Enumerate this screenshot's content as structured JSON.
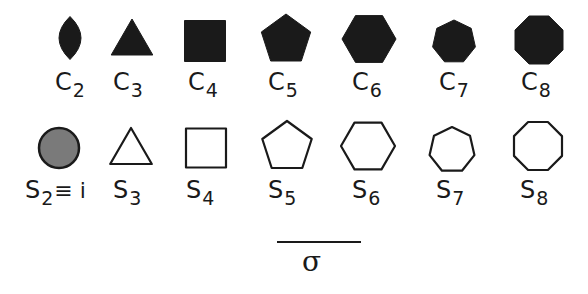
{
  "colors": {
    "ink": "#1a1a1a",
    "s2_fill": "#7a7a7a",
    "background": "#ffffff"
  },
  "rows": {
    "cyclic": {
      "style": "filled",
      "items": [
        {
          "symbol": "C",
          "order": "2",
          "shape": "lens-icon",
          "cx": 70,
          "cy": 38,
          "w": 22,
          "h": 43,
          "label_x": 55,
          "label_y": 70
        },
        {
          "symbol": "C",
          "order": "3",
          "shape": "triangle-icon",
          "cx": 132,
          "cy": 43,
          "sides": 3,
          "r": 24,
          "label_x": 113,
          "label_y": 70
        },
        {
          "symbol": "C",
          "order": "4",
          "shape": "square-icon",
          "cx": 205,
          "cy": 41,
          "w": 41,
          "h": 41,
          "label_x": 188,
          "label_y": 70
        },
        {
          "symbol": "C",
          "order": "5",
          "shape": "pentagon-icon",
          "cx": 286,
          "cy": 40,
          "sides": 5,
          "r": 26,
          "label_x": 268,
          "label_y": 70
        },
        {
          "symbol": "C",
          "order": "6",
          "shape": "hexagon-icon",
          "cx": 369,
          "cy": 39,
          "sides": 6,
          "r": 27,
          "label_x": 352,
          "label_y": 70
        },
        {
          "symbol": "C",
          "order": "7",
          "shape": "heptagon-icon",
          "cx": 454,
          "cy": 42,
          "sides": 7,
          "r": 22,
          "label_x": 439,
          "label_y": 70
        },
        {
          "symbol": "C",
          "order": "8",
          "shape": "octagon-icon",
          "cx": 539,
          "cy": 40,
          "sides": 8,
          "r": 26,
          "label_x": 521,
          "label_y": 70
        }
      ]
    },
    "improper": {
      "style": "outline",
      "items": [
        {
          "symbol": "S",
          "order": "2",
          "extra": "≡ i",
          "shape": "circle-icon",
          "cx": 59,
          "cy": 148,
          "r": 20,
          "label_x": 25,
          "label_y": 178
        },
        {
          "symbol": "S",
          "order": "3",
          "shape": "triangle-icon",
          "cx": 131,
          "cy": 152,
          "sides": 3,
          "r": 24,
          "label_x": 113,
          "label_y": 178
        },
        {
          "symbol": "S",
          "order": "4",
          "shape": "square-icon",
          "cx": 206,
          "cy": 148,
          "w": 40,
          "h": 39,
          "label_x": 186,
          "label_y": 178
        },
        {
          "symbol": "S",
          "order": "5",
          "shape": "pentagon-icon",
          "cx": 287,
          "cy": 147,
          "sides": 5,
          "r": 26,
          "label_x": 268,
          "label_y": 178
        },
        {
          "symbol": "S",
          "order": "6",
          "shape": "hexagon-icon",
          "cx": 368,
          "cy": 146,
          "sides": 6,
          "r": 27,
          "label_x": 352,
          "label_y": 178
        },
        {
          "symbol": "S",
          "order": "7",
          "shape": "heptagon-icon",
          "cx": 452,
          "cy": 150,
          "sides": 7,
          "r": 23,
          "label_x": 436,
          "label_y": 178
        },
        {
          "symbol": "S",
          "order": "8",
          "shape": "octagon-icon",
          "cx": 538,
          "cy": 146,
          "sides": 8,
          "r": 26,
          "label_x": 520,
          "label_y": 178
        }
      ]
    }
  },
  "mirror": {
    "bar": {
      "x": 277,
      "y": 241,
      "width": 84
    },
    "symbol": "σ",
    "symbol_x": 302,
    "symbol_y": 248
  }
}
